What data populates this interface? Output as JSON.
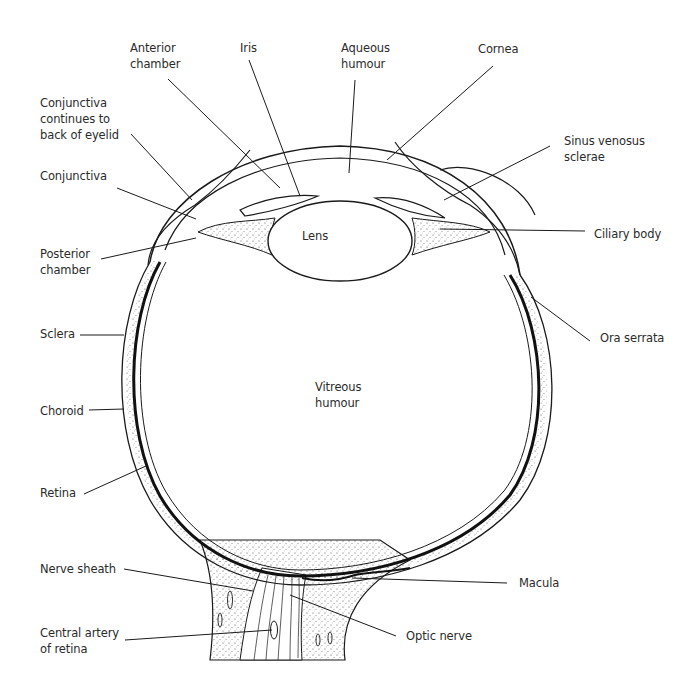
{
  "diagram": {
    "colors": {
      "ink": "#1a1a1a",
      "text": "#2b2b2b",
      "background": "#ffffff"
    },
    "labels": [
      {
        "id": "anterior-chamber",
        "text": "Anterior\nchamber",
        "x": 130,
        "y": 40
      },
      {
        "id": "iris",
        "text": "Iris",
        "x": 240,
        "y": 40
      },
      {
        "id": "aqueous-humour",
        "text": "Aqueous\nhumour",
        "x": 341,
        "y": 40
      },
      {
        "id": "cornea",
        "text": "Cornea",
        "x": 478,
        "y": 41
      },
      {
        "id": "conjunctiva-eyelid",
        "text": "Conjunctiva\ncontinues to\nback of eyelid",
        "x": 40,
        "y": 95
      },
      {
        "id": "sinus-venosus-sclerae",
        "text": "Sinus venosus\nsclerae",
        "x": 564,
        "y": 133
      },
      {
        "id": "conjunctiva",
        "text": "Conjunctiva",
        "x": 40,
        "y": 168
      },
      {
        "id": "lens",
        "text": "Lens",
        "x": 302,
        "y": 228
      },
      {
        "id": "ciliary-body",
        "text": "Ciliary body",
        "x": 594,
        "y": 226
      },
      {
        "id": "posterior-chamber",
        "text": "Posterior\nchamber",
        "x": 40,
        "y": 246
      },
      {
        "id": "sclera",
        "text": "Sclera",
        "x": 40,
        "y": 326
      },
      {
        "id": "ora-serrata",
        "text": "Ora serrata",
        "x": 600,
        "y": 330
      },
      {
        "id": "vitreous-humour",
        "text": "Vitreous\nhumour",
        "x": 315,
        "y": 379
      },
      {
        "id": "choroid",
        "text": "Choroid",
        "x": 40,
        "y": 403
      },
      {
        "id": "retina",
        "text": "Retina",
        "x": 40,
        "y": 485
      },
      {
        "id": "nerve-sheath",
        "text": "Nerve sheath",
        "x": 40,
        "y": 561
      },
      {
        "id": "macula",
        "text": "Macula",
        "x": 519,
        "y": 575
      },
      {
        "id": "central-artery-of-retina",
        "text": "Central artery\nof retina",
        "x": 40,
        "y": 625
      },
      {
        "id": "optic-nerve",
        "text": "Optic nerve",
        "x": 406,
        "y": 628
      }
    ],
    "leader_lines": [
      {
        "label": "anterior-chamber",
        "x1": 168,
        "y1": 79,
        "x2": 280,
        "y2": 188
      },
      {
        "label": "iris",
        "x1": 249,
        "y1": 60,
        "x2": 300,
        "y2": 196
      },
      {
        "label": "aqueous-humour",
        "x1": 355,
        "y1": 80,
        "x2": 349,
        "y2": 173
      },
      {
        "label": "cornea",
        "x1": 493,
        "y1": 66,
        "x2": 387,
        "y2": 160
      },
      {
        "label": "conjunctiva-eyelid",
        "x1": 131,
        "y1": 134,
        "x2": 192,
        "y2": 200
      },
      {
        "label": "sinus-venosus-sclerae",
        "x1": 550,
        "y1": 146,
        "x2": 444,
        "y2": 200
      },
      {
        "label": "conjunctiva",
        "x1": 117,
        "y1": 188,
        "x2": 196,
        "y2": 219
      },
      {
        "label": "ciliary-body",
        "x1": 585,
        "y1": 231,
        "x2": 440,
        "y2": 229
      },
      {
        "label": "posterior-chamber",
        "x1": 101,
        "y1": 259,
        "x2": 196,
        "y2": 238
      },
      {
        "label": "sclera",
        "x1": 80,
        "y1": 335,
        "x2": 124,
        "y2": 335
      },
      {
        "label": "ora-serrata",
        "x1": 590,
        "y1": 341,
        "x2": 531,
        "y2": 297
      },
      {
        "label": "choroid",
        "x1": 89,
        "y1": 410,
        "x2": 124,
        "y2": 409
      },
      {
        "label": "retina",
        "x1": 84,
        "y1": 494,
        "x2": 146,
        "y2": 466
      },
      {
        "label": "nerve-sheath",
        "x1": 124,
        "y1": 569,
        "x2": 253,
        "y2": 591
      },
      {
        "label": "macula",
        "x1": 507,
        "y1": 583,
        "x2": 352,
        "y2": 578
      },
      {
        "label": "central-artery-of-retina",
        "x1": 125,
        "y1": 640,
        "x2": 272,
        "y2": 630
      },
      {
        "label": "optic-nerve",
        "x1": 396,
        "y1": 636,
        "x2": 290,
        "y2": 595
      }
    ]
  }
}
